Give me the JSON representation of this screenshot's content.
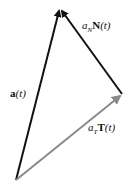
{
  "diagram": {
    "colors": {
      "black": "#111111",
      "gray": "#8a8a8a"
    },
    "vectors": [
      {
        "id": "a",
        "from": [
          16,
          180
        ],
        "to": [
          60,
          8
        ],
        "color": "#111111"
      },
      {
        "id": "aN",
        "from": [
          122,
          94
        ],
        "to": [
          60,
          8
        ],
        "color": "#111111"
      },
      {
        "id": "aT",
        "from": [
          16,
          180
        ],
        "to": [
          122,
          94
        ],
        "color": "#8a8a8a"
      }
    ],
    "labels": {
      "a": {
        "bold": "a",
        "rest": "(t)"
      },
      "aN": {
        "coef": "a",
        "sub": "N",
        "bold": "N",
        "rest": "(t)"
      },
      "aT": {
        "coef": "a",
        "sub": "T",
        "bold": "T",
        "rest": "(t)"
      }
    }
  }
}
